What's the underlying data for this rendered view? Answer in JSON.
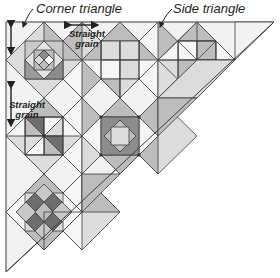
{
  "diagram": {
    "labels": {
      "corner_triangle": "Corner triangle",
      "side_triangle": "Side triangle",
      "straight_grain_top_line1": "Straight",
      "straight_grain_top_line2": "grain",
      "straight_grain_left_line1": "Straight",
      "straight_grain_left_line2": "grain"
    },
    "colors": {
      "outline": "#3a3a3a",
      "white": "#f6f6f6",
      "light": "#dcdcdc",
      "medium": "#bdbdbd",
      "dark": "#8c8c8c",
      "darker": "#6e6e6e",
      "setting_triangle": "#f0f0f0"
    },
    "blocks": [
      {
        "name": "corner-block-square-in-square",
        "cx": 44,
        "cy": 60
      },
      {
        "name": "block-top-middle",
        "cx": 120,
        "cy": 60
      },
      {
        "name": "block-top-right-pinwheel",
        "cx": 197,
        "cy": 60
      },
      {
        "name": "block-pinwheel",
        "cx": 44,
        "cy": 136
      },
      {
        "name": "block-square-in-square-dark",
        "cx": 120,
        "cy": 136
      },
      {
        "name": "block-bottom-cross",
        "cx": 44,
        "cy": 212
      }
    ]
  }
}
